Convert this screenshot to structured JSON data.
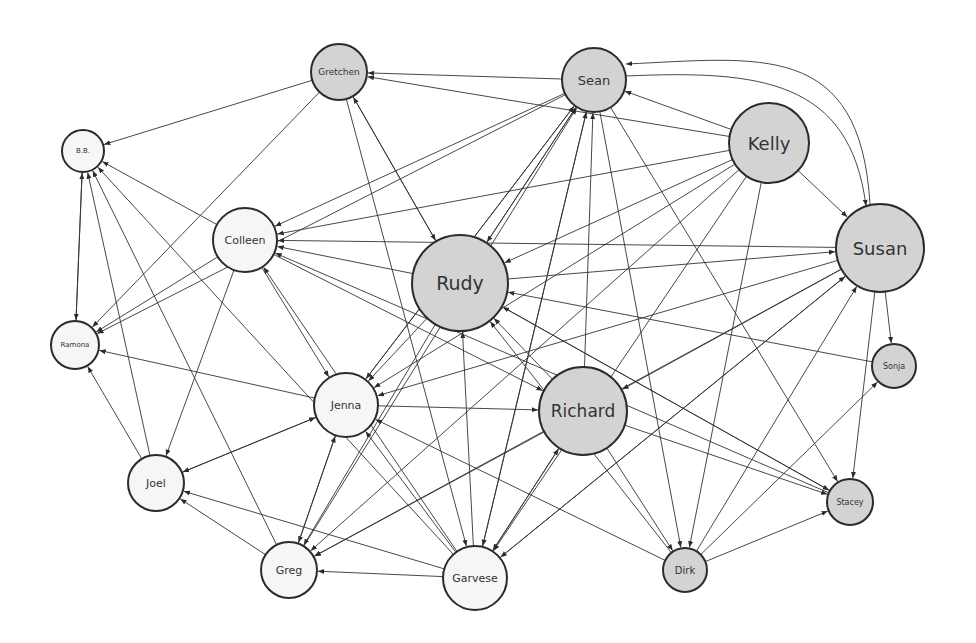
{
  "diagram": {
    "type": "directed-network",
    "colors": {
      "edge": "#333333",
      "node_stroke": "#2b2b2b",
      "gray_fill": "#d3d3d3",
      "white_fill": "#f6f6f6",
      "label": "#333333"
    },
    "nodes": [
      {
        "id": "gretchen",
        "label": "Gretchen",
        "x": 339,
        "y": 72,
        "r": 28,
        "fill": "gray",
        "fs": 9
      },
      {
        "id": "sean",
        "label": "Sean",
        "x": 594,
        "y": 80,
        "r": 32,
        "fill": "gray",
        "fs": 13
      },
      {
        "id": "kelly",
        "label": "Kelly",
        "x": 769,
        "y": 143,
        "r": 40,
        "fill": "gray",
        "fs": 18
      },
      {
        "id": "bb",
        "label": "B.B.",
        "x": 83,
        "y": 151,
        "r": 21,
        "fill": "white",
        "fs": 7
      },
      {
        "id": "colleen",
        "label": "Colleen",
        "x": 245,
        "y": 240,
        "r": 32,
        "fill": "white",
        "fs": 11
      },
      {
        "id": "rudy",
        "label": "Rudy",
        "x": 460,
        "y": 283,
        "r": 48,
        "fill": "gray",
        "fs": 19
      },
      {
        "id": "susan",
        "label": "Susan",
        "x": 880,
        "y": 248,
        "r": 44,
        "fill": "gray",
        "fs": 18
      },
      {
        "id": "ramona",
        "label": "Ramona",
        "x": 75,
        "y": 345,
        "r": 24,
        "fill": "white",
        "fs": 7
      },
      {
        "id": "sonja",
        "label": "Sonja",
        "x": 894,
        "y": 366,
        "r": 22,
        "fill": "gray",
        "fs": 8
      },
      {
        "id": "jenna",
        "label": "Jenna",
        "x": 346,
        "y": 405,
        "r": 32,
        "fill": "white",
        "fs": 11
      },
      {
        "id": "richard",
        "label": "Richard",
        "x": 583,
        "y": 411,
        "r": 44,
        "fill": "gray",
        "fs": 17
      },
      {
        "id": "joel",
        "label": "Joel",
        "x": 156,
        "y": 483,
        "r": 28,
        "fill": "white",
        "fs": 11
      },
      {
        "id": "stacey",
        "label": "Stacey",
        "x": 850,
        "y": 502,
        "r": 23,
        "fill": "gray",
        "fs": 8
      },
      {
        "id": "greg",
        "label": "Greg",
        "x": 289,
        "y": 570,
        "r": 28,
        "fill": "white",
        "fs": 11
      },
      {
        "id": "garvese",
        "label": "Garvese",
        "x": 475,
        "y": 578,
        "r": 32,
        "fill": "white",
        "fs": 11
      },
      {
        "id": "dirk",
        "label": "Dirk",
        "x": 685,
        "y": 570,
        "r": 22,
        "fill": "gray",
        "fs": 10
      }
    ],
    "edges": [
      [
        "gretchen",
        "bb"
      ],
      [
        "gretchen",
        "ramona"
      ],
      [
        "gretchen",
        "rudy"
      ],
      [
        "gretchen",
        "garvese"
      ],
      [
        "sean",
        "gretchen"
      ],
      [
        "sean",
        "colleen"
      ],
      [
        "sean",
        "ramona"
      ],
      [
        "sean",
        "rudy"
      ],
      [
        "sean",
        "dirk"
      ],
      [
        "sean",
        "stacey"
      ],
      [
        "sean",
        "garvese"
      ],
      [
        "sean",
        "jenna"
      ],
      [
        "kelly",
        "sean"
      ],
      [
        "kelly",
        "gretchen"
      ],
      [
        "kelly",
        "colleen"
      ],
      [
        "kelly",
        "rudy"
      ],
      [
        "kelly",
        "susan"
      ],
      [
        "kelly",
        "dirk"
      ],
      [
        "kelly",
        "greg"
      ],
      [
        "kelly",
        "garvese"
      ],
      [
        "kelly",
        "jenna"
      ],
      [
        "susan",
        "sean"
      ],
      [
        "susan",
        "colleen"
      ],
      [
        "susan",
        "sonja"
      ],
      [
        "susan",
        "stacey"
      ],
      [
        "susan",
        "greg"
      ],
      [
        "susan",
        "jenna"
      ],
      [
        "susan",
        "richard"
      ],
      [
        "susan",
        "garvese"
      ],
      [
        "sean",
        "susan"
      ],
      [
        "colleen",
        "bb"
      ],
      [
        "colleen",
        "ramona"
      ],
      [
        "colleen",
        "joel"
      ],
      [
        "colleen",
        "jenna"
      ],
      [
        "colleen",
        "richard"
      ],
      [
        "rudy",
        "colleen"
      ],
      [
        "rudy",
        "sean"
      ],
      [
        "rudy",
        "susan"
      ],
      [
        "rudy",
        "jenna"
      ],
      [
        "rudy",
        "greg"
      ],
      [
        "rudy",
        "stacey"
      ],
      [
        "rudy",
        "gretchen"
      ],
      [
        "richard",
        "sean"
      ],
      [
        "richard",
        "rudy"
      ],
      [
        "richard",
        "dirk"
      ],
      [
        "richard",
        "stacey"
      ],
      [
        "richard",
        "greg"
      ],
      [
        "richard",
        "garvese"
      ],
      [
        "jenna",
        "ramona"
      ],
      [
        "jenna",
        "joel"
      ],
      [
        "jenna",
        "greg"
      ],
      [
        "jenna",
        "richard"
      ],
      [
        "jenna",
        "sean"
      ],
      [
        "joel",
        "bb"
      ],
      [
        "joel",
        "ramona"
      ],
      [
        "joel",
        "jenna"
      ],
      [
        "greg",
        "bb"
      ],
      [
        "greg",
        "joel"
      ],
      [
        "greg",
        "jenna"
      ],
      [
        "greg",
        "sean"
      ],
      [
        "garvese",
        "bb"
      ],
      [
        "garvese",
        "joel"
      ],
      [
        "garvese",
        "jenna"
      ],
      [
        "garvese",
        "greg"
      ],
      [
        "garvese",
        "rudy"
      ],
      [
        "garvese",
        "sean"
      ],
      [
        "garvese",
        "richard"
      ],
      [
        "garvese",
        "susan"
      ],
      [
        "garvese",
        "colleen"
      ],
      [
        "dirk",
        "stacey"
      ],
      [
        "dirk",
        "susan"
      ],
      [
        "dirk",
        "sonja"
      ],
      [
        "dirk",
        "rudy"
      ],
      [
        "sonja",
        "rudy"
      ],
      [
        "stacey",
        "rudy"
      ],
      [
        "stacey",
        "colleen"
      ],
      [
        "ramona",
        "bb"
      ],
      [
        "bb",
        "ramona"
      ],
      [
        "dirk",
        "jenna"
      ]
    ]
  }
}
